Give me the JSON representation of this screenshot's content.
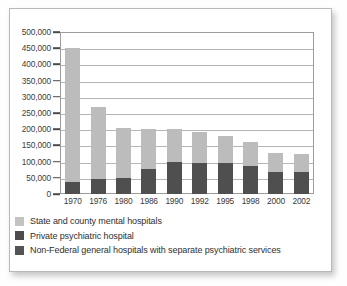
{
  "chart_data": {
    "type": "bar",
    "subtype": "stacked-bar",
    "title": "",
    "xlabel": "",
    "ylabel": "",
    "ylim": [
      0,
      500000
    ],
    "ytick_step": 50000,
    "grid": true,
    "legend_position": "below",
    "categories": [
      "1970",
      "1976",
      "1980",
      "1986",
      "1990",
      "1992",
      "1995",
      "1998",
      "2000",
      "2002"
    ],
    "ytick_labels": [
      "0",
      "50,000",
      "100,000",
      "150,000",
      "200,000",
      "250,000",
      "300,000",
      "350,000",
      "400,000",
      "450,000",
      "500,000"
    ],
    "series": [
      {
        "name": "Non-Federal general hospitals with separate psychiatric services",
        "color": "#4f4f4f",
        "stack_order": 1,
        "values": [
          38000,
          47000,
          48000,
          78000,
          100000,
          97000,
          96000,
          88000,
          68000,
          67000
        ]
      },
      {
        "name": "State and county mental hospitals",
        "color": "#bcbcbc",
        "stack_order": 2,
        "values": [
          414000,
          221000,
          157000,
          124000,
          100000,
          94000,
          84000,
          73000,
          60000,
          58000
        ]
      }
    ],
    "totals": [
      452000,
      268000,
      205000,
      202000,
      200000,
      191000,
      180000,
      161000,
      128000,
      125000
    ]
  },
  "legend": {
    "items": [
      {
        "label": "State and county mental hospitals",
        "swatch": "light-gray-swatch"
      },
      {
        "label": "Private psychiatric hospital",
        "swatch": "dark-gray-swatch"
      },
      {
        "label": "Non-Federal general hospitals with separate psychiatric services",
        "swatch": "dark-gray-swatch"
      }
    ]
  },
  "colors": {
    "series_light": "#bcbcbc",
    "series_dark": "#4f4f4f",
    "gridline": "#b5b5b5",
    "axis": "#4a4a4a",
    "frame": "#b9b9b9",
    "text": "#3a3a3a"
  }
}
